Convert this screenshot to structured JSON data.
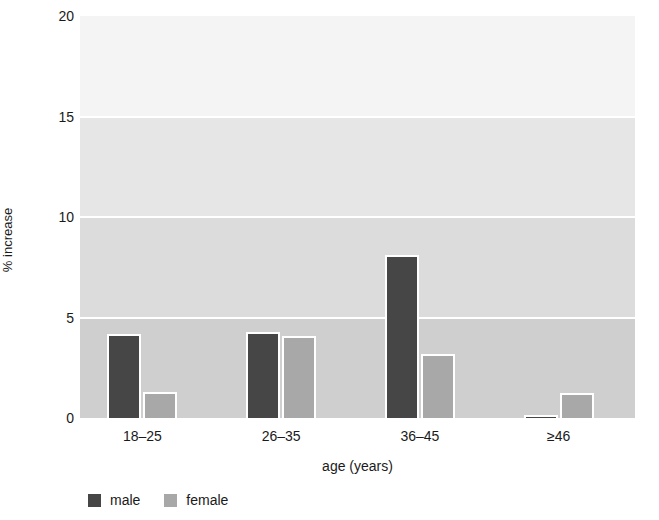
{
  "chart_data": {
    "type": "bar",
    "title": "",
    "subtitle": "",
    "xlabel": "age (years)",
    "ylabel": "% increase",
    "categories": [
      "18–25",
      "26–35",
      "36–45",
      "≥46"
    ],
    "series": [
      {
        "name": "male",
        "color": "#464646",
        "values": [
          4.2,
          4.3,
          8.1,
          0.15
        ]
      },
      {
        "name": "female",
        "color": "#a8a8a8",
        "values": [
          1.3,
          4.1,
          3.2,
          1.25
        ]
      }
    ],
    "ylim": [
      0,
      20
    ],
    "yticks": [
      0,
      5,
      10,
      15,
      20
    ],
    "ytick_labels": [
      "0",
      "5",
      "10",
      "15",
      "20"
    ],
    "grid": "horizontal-white-gridlines",
    "legend_position": "bottom-left",
    "plot_background_bands": [
      "#f4f4f4",
      "#e6e6e6",
      "#dcdcdc",
      "#cfcfcf"
    ]
  },
  "legend": {
    "items": [
      {
        "label": "male",
        "swatch": "male-swatch"
      },
      {
        "label": "female",
        "swatch": "female-swatch"
      }
    ]
  }
}
